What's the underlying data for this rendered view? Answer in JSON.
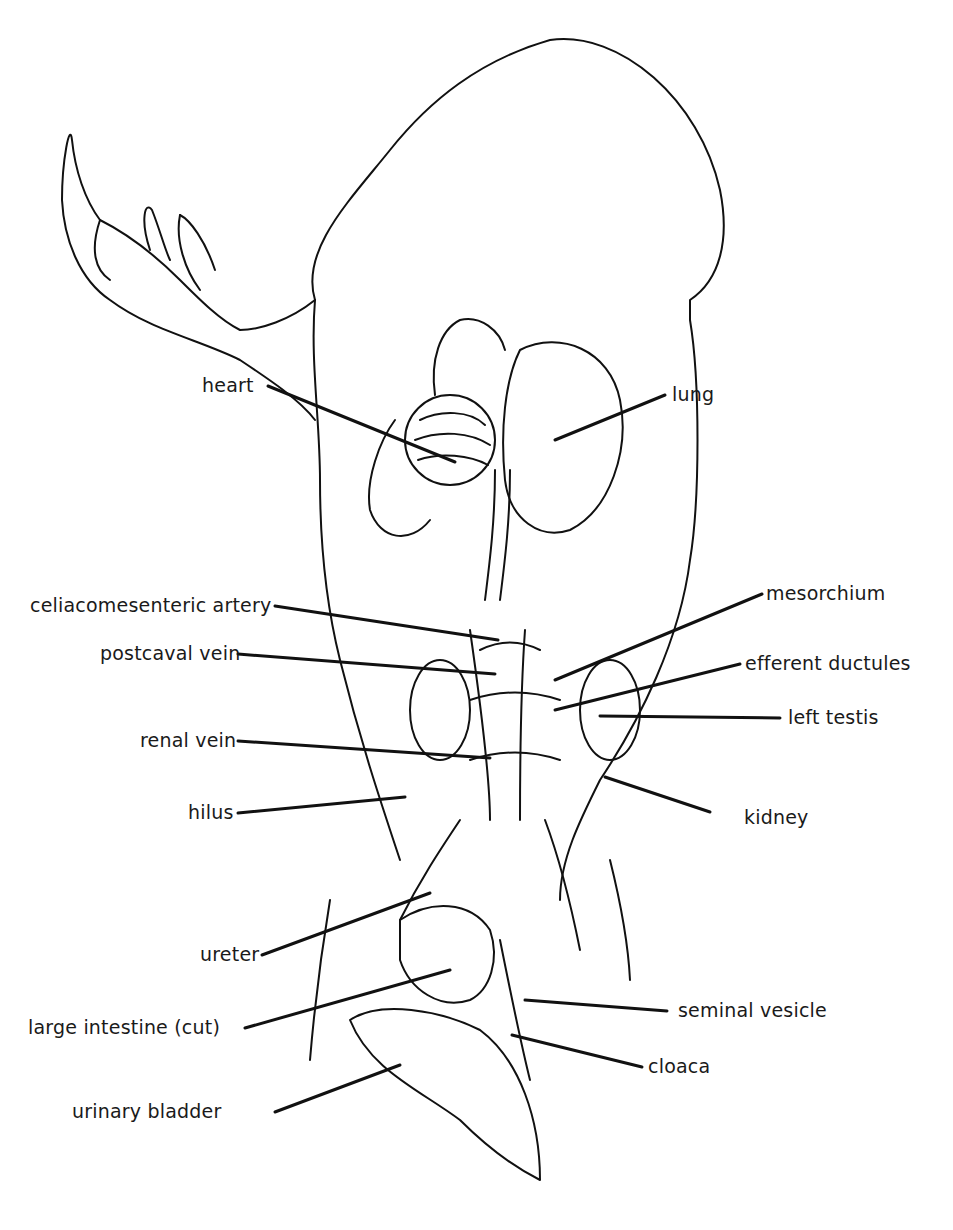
{
  "figure": {
    "labels": {
      "heart": "heart",
      "lung": "lung",
      "celiacomesenteric_artery": "celiacomesenteric artery",
      "mesorchium": "mesorchium",
      "postcaval_vein": "postcaval vein",
      "efferent_ductules": "efferent ductules",
      "left_testis": "left testis",
      "renal_vein": "renal vein",
      "hilus": "hilus",
      "kidney": "kidney",
      "ureter": "ureter",
      "large_intestine": "large intestine (cut)",
      "seminal_vesicle": "seminal vesicle",
      "cloaca": "cloaca",
      "urinary_bladder": "urinary bladder"
    }
  }
}
